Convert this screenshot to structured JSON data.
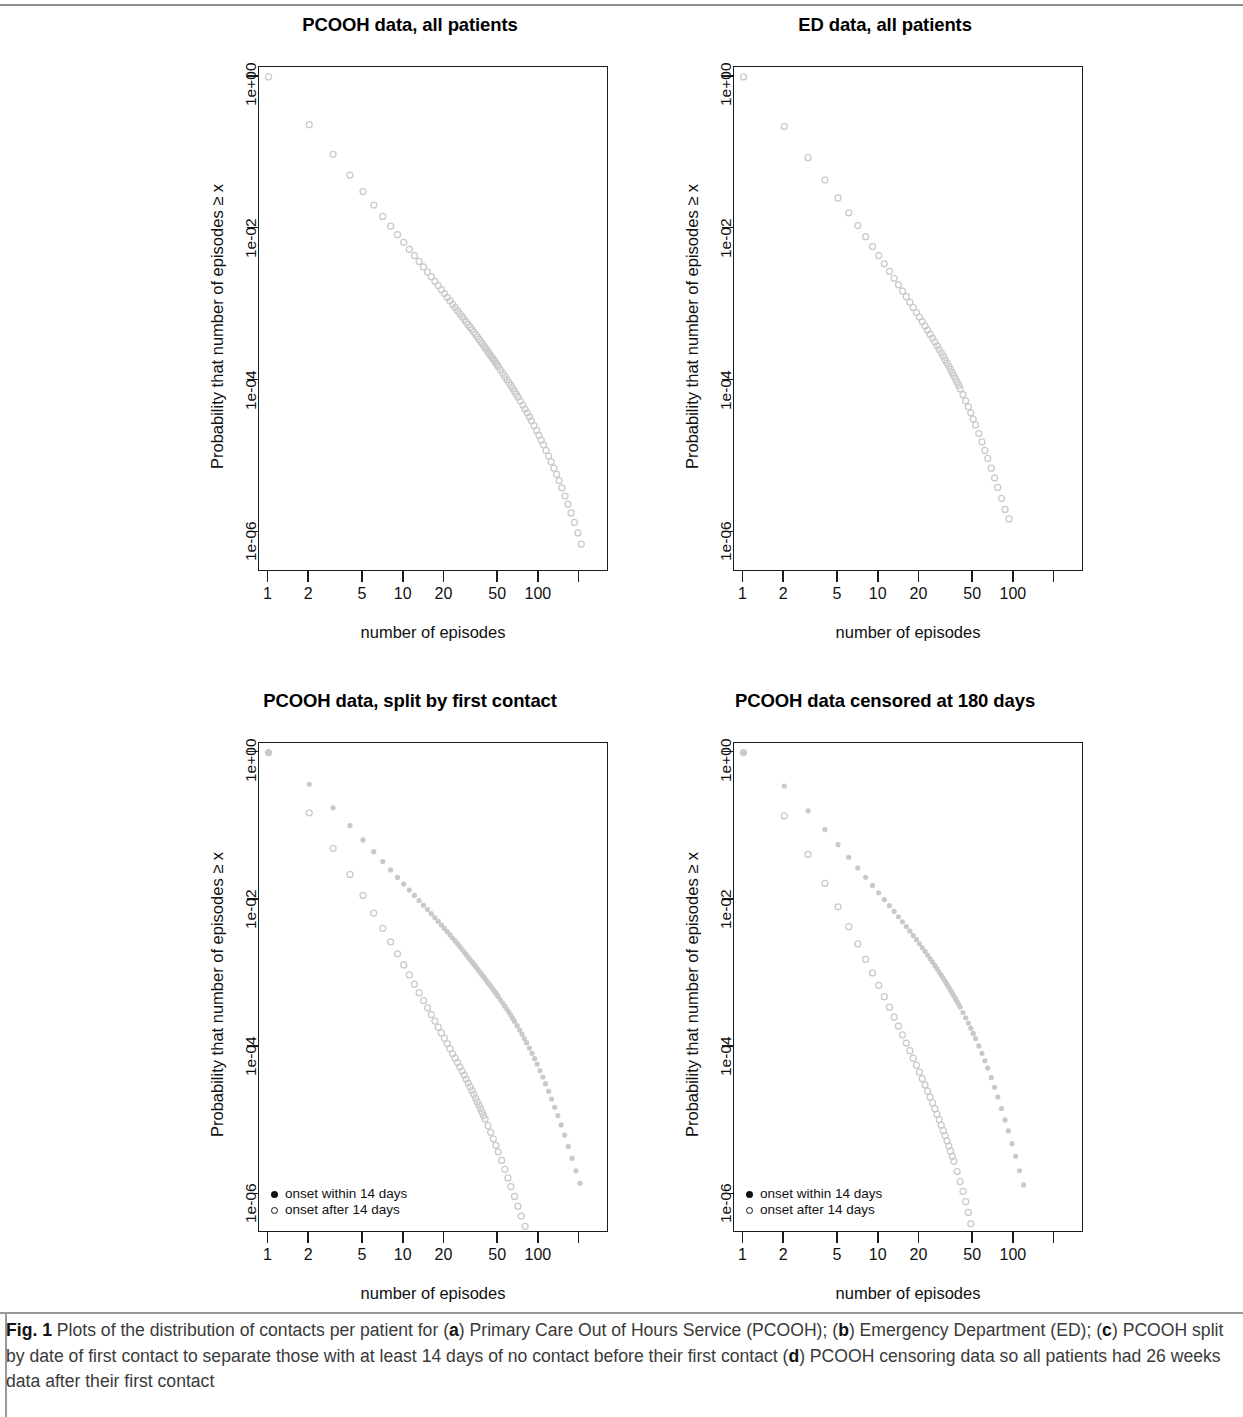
{
  "figure": {
    "label": "Fig. 1",
    "caption_parts": [
      {
        "t": "Plots of the distribution of contacts per patient for (",
        "b": false
      },
      {
        "t": "a",
        "b": true
      },
      {
        "t": ") Primary Care Out of Hours Service (PCOOH); (",
        "b": false
      },
      {
        "t": "b",
        "b": true
      },
      {
        "t": ") Emergency Department (ED); (",
        "b": false
      },
      {
        "t": "c",
        "b": true
      },
      {
        "t": ") PCOOH split by date of first contact to separate those with at least 14 days of no contact before their first contact (",
        "b": false
      },
      {
        "t": "d",
        "b": true
      },
      {
        "t": ") PCOOH censoring data so all patients had 26 weeks data after their first contact",
        "b": false
      }
    ],
    "caption_plain": "Fig. 1 Plots of the distribution of contacts per patient for (a) Primary Care Out of Hours Service (PCOOH); (b) Emergency Department (ED); (c) PCOOH split by date of first contact to separate those with at least 14 days of no contact before their first contact (d) PCOOH censoring data so all patients had 26 weeks data after their first contact"
  },
  "common": {
    "xlabel": "number of episodes",
    "ylabel": "Probability that number of episodes ≥ x",
    "x_tick_values": [
      1,
      2,
      5,
      10,
      20,
      50,
      100,
      200
    ],
    "x_tick_labels": [
      "1",
      "2",
      "5",
      "10",
      "20",
      "50",
      "100",
      ""
    ],
    "y_tick_values": [
      1,
      0.01,
      0.0001,
      1e-06
    ],
    "y_tick_labels": [
      "1e+00",
      "1e-02",
      "1e-04",
      "1e-06"
    ],
    "xlim": [
      0.85,
      330
    ],
    "ylim": [
      3e-07,
      1.35
    ],
    "point_color": "#c9c9c9",
    "axis_color": "#1b1b1b",
    "marker_open": "open-circle",
    "marker_filled": "filled-circle"
  },
  "chart_data": [
    {
      "panel": "a",
      "type": "scatter",
      "title": "PCOOH data, all patients",
      "xlabel": "number of episodes",
      "ylabel": "Probability that number of episodes ≥ x",
      "xscale": "log",
      "yscale": "log",
      "xlim": [
        0.85,
        330
      ],
      "ylim": [
        3e-07,
        1.35
      ],
      "grid": false,
      "legend": null,
      "series": [
        {
          "name": "all patients",
          "marker": "open-circle",
          "x": [
            1,
            2,
            3,
            4,
            5,
            6,
            7,
            8,
            9,
            10,
            11,
            12,
            13,
            14,
            15,
            16,
            17,
            18,
            19,
            20,
            21,
            22,
            23,
            24,
            25,
            26,
            27,
            28,
            29,
            30,
            31,
            32,
            33,
            34,
            35,
            36,
            37,
            38,
            39,
            40,
            41,
            42,
            43,
            44,
            45,
            46,
            47,
            48,
            49,
            50,
            52,
            54,
            56,
            58,
            60,
            62,
            64,
            66,
            68,
            70,
            73,
            76,
            79,
            82,
            85,
            88,
            92,
            96,
            100,
            104,
            108,
            113,
            118,
            123,
            129,
            135,
            141,
            148,
            156,
            164,
            173,
            183,
            194,
            206
          ],
          "y": [
            1.0,
            0.235,
            0.0955,
            0.0508,
            0.0308,
            0.0205,
            0.0145,
            0.0108,
            0.00835,
            0.00662,
            0.00536,
            0.00442,
            0.0037,
            0.00314,
            0.00269,
            0.00233,
            0.00203,
            0.00178,
            0.00157,
            0.0014,
            0.00125,
            0.00112,
            0.00101,
            0.000915,
            0.000832,
            0.00076,
            0.000696,
            0.00064,
            0.000589,
            0.000544,
            0.000504,
            0.000467,
            0.000434,
            0.000404,
            0.000377,
            0.000352,
            0.000329,
            0.000308,
            0.000289,
            0.000271,
            0.000255,
            0.00024,
            0.000226,
            0.000213,
            0.000201,
            0.00019,
            0.00018,
            0.00017,
            0.000161,
            0.000153,
            0.000138,
            0.000125,
            0.000113,
            0.000103,
            9.4e-05,
            8.6e-05,
            7.85e-05,
            7.2e-05,
            6.6e-05,
            6.05e-05,
            5.35e-05,
            4.75e-05,
            4.2e-05,
            3.75e-05,
            3.32e-05,
            2.95e-05,
            2.55e-05,
            2.2e-05,
            1.9e-05,
            1.64e-05,
            1.42e-05,
            1.2e-05,
            1.01e-05,
            8.5e-06,
            7e-06,
            5.8e-06,
            4.8e-06,
            3.85e-06,
            3e-06,
            2.35e-06,
            1.8e-06,
            1.35e-06,
            9.8e-07,
            7e-07
          ]
        }
      ]
    },
    {
      "panel": "b",
      "type": "scatter",
      "title": "ED data, all patients",
      "xlabel": "number of episodes",
      "ylabel": "Probability that number of episodes ≥ x",
      "xscale": "log",
      "yscale": "log",
      "xlim": [
        0.85,
        330
      ],
      "ylim": [
        3e-07,
        1.35
      ],
      "grid": false,
      "legend": null,
      "series": [
        {
          "name": "all patients",
          "marker": "open-circle",
          "x": [
            1,
            2,
            3,
            4,
            5,
            6,
            7,
            8,
            9,
            10,
            11,
            12,
            13,
            14,
            15,
            16,
            17,
            18,
            19,
            20,
            21,
            22,
            23,
            24,
            25,
            26,
            27,
            28,
            29,
            30,
            31,
            32,
            33,
            34,
            35,
            36,
            37,
            38,
            39,
            40,
            42,
            44,
            46,
            48,
            50,
            52,
            55,
            58,
            61,
            64,
            68,
            72,
            76,
            81,
            86,
            92
          ],
          "y": [
            1.0,
            0.222,
            0.0862,
            0.0437,
            0.0254,
            0.0162,
            0.011,
            0.00785,
            0.00582,
            0.00443,
            0.00345,
            0.00275,
            0.00222,
            0.00182,
            0.00151,
            0.00127,
            0.00107,
            0.000918,
            0.000791,
            0.000686,
            0.000598,
            0.000524,
            0.000461,
            0.000408,
            0.000362,
            0.000322,
            0.000288,
            0.000258,
            0.000232,
            0.000209,
            0.000188,
            0.00017,
            0.000154,
            0.00014,
            0.000127,
            0.000115,
            0.000105,
            9.5e-05,
            8.6e-05,
            7.8e-05,
            6.5e-05,
            5.4e-05,
            4.5e-05,
            3.75e-05,
            3.1e-05,
            2.6e-05,
            2e-05,
            1.55e-05,
            1.2e-05,
            9.4e-06,
            7e-06,
            5.2e-06,
            3.9e-06,
            2.8e-06,
            2e-06,
            1.5e-06
          ]
        }
      ]
    },
    {
      "panel": "c",
      "type": "scatter",
      "title": "PCOOH data, split by first contact",
      "xlabel": "number of episodes",
      "ylabel": "Probability that number of episodes ≥ x",
      "xscale": "log",
      "yscale": "log",
      "xlim": [
        0.85,
        330
      ],
      "ylim": [
        3e-07,
        1.35
      ],
      "grid": false,
      "legend": {
        "position": "bottom-left",
        "entries": [
          "onset within 14 days",
          "onset after 14 days"
        ]
      },
      "series": [
        {
          "name": "onset within 14 days",
          "marker": "filled-circle",
          "x": [
            1,
            2,
            3,
            4,
            5,
            6,
            7,
            8,
            9,
            10,
            11,
            12,
            13,
            14,
            15,
            16,
            17,
            18,
            19,
            20,
            21,
            22,
            23,
            24,
            25,
            26,
            27,
            28,
            29,
            30,
            31,
            32,
            33,
            34,
            35,
            36,
            37,
            38,
            39,
            40,
            41,
            42,
            43,
            44,
            45,
            46,
            47,
            48,
            49,
            50,
            52,
            54,
            56,
            58,
            60,
            62,
            64,
            66,
            69,
            72,
            75,
            78,
            81,
            85,
            89,
            93,
            97,
            102,
            107,
            112,
            118,
            124,
            131,
            138,
            146,
            155,
            165,
            176,
            188,
            201
          ],
          "y": [
            1.0,
            0.372,
            0.178,
            0.102,
            0.0652,
            0.0452,
            0.0332,
            0.0255,
            0.0202,
            0.0164,
            0.0136,
            0.0115,
            0.00982,
            0.00848,
            0.00739,
            0.00649,
            0.00574,
            0.00511,
            0.00456,
            0.0041,
            0.0037,
            0.00335,
            0.00304,
            0.00277,
            0.00253,
            0.00232,
            0.00213,
            0.00196,
            0.00181,
            0.00167,
            0.00155,
            0.00144,
            0.00134,
            0.00125,
            0.00117,
            0.00109,
            0.00102,
            0.000958,
            0.0009,
            0.000847,
            0.000798,
            0.000753,
            0.000711,
            0.000672,
            0.000636,
            0.000602,
            0.00057,
            0.000541,
            0.000513,
            0.000487,
            0.00044,
            0.000398,
            0.00036,
            0.000327,
            0.000297,
            0.00027,
            0.000246,
            0.000224,
            0.000196,
            0.000171,
            0.00015,
            0.000131,
            0.000115,
            9.75e-05,
            8.25e-05,
            7e-05,
            5.9e-05,
            4.82e-05,
            3.94e-05,
            3.2e-05,
            2.52e-05,
            1.98e-05,
            1.53e-05,
            1.18e-05,
            8.8e-06,
            6.4e-06,
            4.5e-06,
            3.1e-06,
            2.1e-06,
            1.42e-06
          ]
        },
        {
          "name": "onset after 14 days",
          "marker": "open-circle",
          "x": [
            1,
            2,
            3,
            4,
            5,
            6,
            7,
            8,
            9,
            10,
            11,
            12,
            13,
            14,
            15,
            16,
            17,
            18,
            19,
            20,
            21,
            22,
            23,
            24,
            25,
            26,
            27,
            28,
            29,
            30,
            31,
            32,
            33,
            34,
            35,
            36,
            37,
            38,
            39,
            40,
            42,
            44,
            46,
            48,
            50,
            53,
            56,
            59,
            62,
            66,
            70,
            74,
            79,
            84,
            90,
            96,
            103
          ],
          "y": [
            1.0,
            0.152,
            0.0502,
            0.0222,
            0.0115,
            0.00662,
            0.00411,
            0.0027,
            0.00185,
            0.00131,
            0.000958,
            0.000718,
            0.00055,
            0.00043,
            0.000342,
            0.000276,
            0.000226,
            0.000187,
            0.000156,
            0.000132,
            0.000112,
            9.55e-05,
            8.2e-05,
            7.1e-05,
            6.18e-05,
            5.4e-05,
            4.74e-05,
            4.17e-05,
            3.68e-05,
            3.26e-05,
            2.89e-05,
            2.57e-05,
            2.29e-05,
            2.04e-05,
            1.82e-05,
            1.63e-05,
            1.46e-05,
            1.31e-05,
            1.18e-05,
            1.06e-05,
            8.6e-06,
            7e-06,
            5.7e-06,
            4.65e-06,
            3.8e-06,
            2.9e-06,
            2.2e-06,
            1.68e-06,
            1.28e-06,
            9.4e-07,
            6.9e-07,
            5.1e-07,
            3.7e-07,
            2.7e-07,
            2e-07,
            1.5e-07,
            1.1e-07
          ]
        }
      ]
    },
    {
      "panel": "d",
      "type": "scatter",
      "title": "PCOOH data censored at 180 days",
      "xlabel": "number of episodes",
      "ylabel": "Probability that number of episodes ≥ x",
      "xscale": "log",
      "yscale": "log",
      "xlim": [
        0.85,
        330
      ],
      "ylim": [
        3e-07,
        1.35
      ],
      "grid": false,
      "legend": {
        "position": "bottom-left",
        "entries": [
          "onset within 14 days",
          "onset after 14 days"
        ]
      },
      "series": [
        {
          "name": "onset within 14 days",
          "marker": "filled-circle",
          "x": [
            1,
            2,
            3,
            4,
            5,
            6,
            7,
            8,
            9,
            10,
            11,
            12,
            13,
            14,
            15,
            16,
            17,
            18,
            19,
            20,
            21,
            22,
            23,
            24,
            25,
            26,
            27,
            28,
            29,
            30,
            31,
            32,
            33,
            34,
            35,
            36,
            37,
            38,
            39,
            40,
            42,
            44,
            46,
            48,
            50,
            52,
            55,
            58,
            61,
            64,
            68,
            72,
            76,
            81,
            86,
            91,
            97,
            103,
            110,
            118
          ],
          "y": [
            1.0,
            0.352,
            0.162,
            0.0902,
            0.0562,
            0.0378,
            0.0271,
            0.0203,
            0.0157,
            0.0125,
            0.0101,
            0.00835,
            0.00698,
            0.0059,
            0.00504,
            0.00434,
            0.00376,
            0.00328,
            0.00288,
            0.00254,
            0.00225,
            0.002,
            0.00178,
            0.00159,
            0.00143,
            0.00129,
            0.00116,
            0.00105,
            0.00095,
            0.000862,
            0.000783,
            0.000713,
            0.00065,
            0.000593,
            0.000542,
            0.000496,
            0.000454,
            0.000416,
            0.000382,
            0.000351,
            0.000296,
            0.000251,
            0.000213,
            0.000181,
            0.000154,
            0.000131,
            0.000104,
            8.25e-05,
            6.55e-05,
            5.2e-05,
            3.85e-05,
            2.85e-05,
            2.1e-05,
            1.47e-05,
            1.03e-05,
            7.3e-06,
            4.9e-06,
            3.3e-06,
            2.1e-06,
            1.35e-06
          ]
        },
        {
          "name": "onset after 14 days",
          "marker": "open-circle",
          "x": [
            1,
            2,
            3,
            4,
            5,
            6,
            7,
            8,
            9,
            10,
            11,
            12,
            13,
            14,
            15,
            16,
            17,
            18,
            19,
            20,
            21,
            22,
            23,
            24,
            25,
            26,
            27,
            28,
            29,
            30,
            31,
            32,
            33,
            34,
            35,
            36,
            38,
            40,
            42,
            44,
            46,
            48,
            50
          ],
          "y": [
            1.0,
            0.138,
            0.0415,
            0.0168,
            0.00805,
            0.00432,
            0.00252,
            0.00156,
            0.00102,
            0.000692,
            0.000485,
            0.000349,
            0.000257,
            0.000193,
            0.000147,
            0.000114,
            8.95e-05,
            7.1e-05,
            5.7e-05,
            4.6e-05,
            3.74e-05,
            3.07e-05,
            2.53e-05,
            2.1e-05,
            1.75e-05,
            1.46e-05,
            1.23e-05,
            1.04e-05,
            8.75e-06,
            7.4e-06,
            6.3e-06,
            5.35e-06,
            4.55e-06,
            3.9e-06,
            3.3e-06,
            2.82e-06,
            2.05e-06,
            1.5e-06,
            1.1e-06,
            8e-07,
            5.7e-07,
            4e-07,
            2.8e-07
          ]
        }
      ]
    }
  ]
}
